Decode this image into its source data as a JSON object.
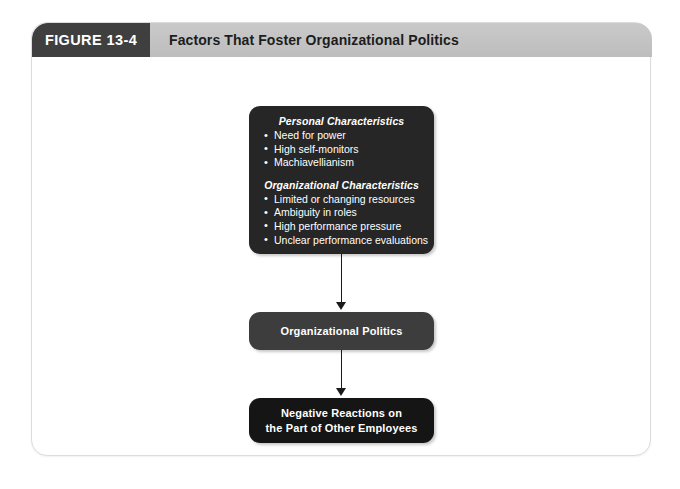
{
  "figure": {
    "tab_label": "FIGURE 13-4",
    "title": "Factors That Foster Organizational Politics"
  },
  "diagram": {
    "type": "flowchart",
    "direction": "top-to-bottom",
    "nodes": [
      {
        "id": "causes",
        "groups": [
          {
            "heading": "Personal Characteristics",
            "items": [
              "Need for power",
              "High self-monitors",
              "Machiavellianism"
            ]
          },
          {
            "heading": "Organizational Characteristics",
            "items": [
              "Limited or changing resources",
              "Ambiguity in roles",
              "High performance pressure",
              "Unclear performance evaluations"
            ]
          }
        ],
        "color": "#262626"
      },
      {
        "id": "politics",
        "text": "Organizational Politics",
        "color": "#3d3d3d"
      },
      {
        "id": "reactions",
        "text": "Negative Reactions on\nthe Part of Other Employees",
        "color": "#151515"
      }
    ],
    "edges": [
      {
        "from": "causes",
        "to": "politics",
        "style": "arrow"
      },
      {
        "from": "politics",
        "to": "reactions",
        "style": "arrow"
      }
    ]
  },
  "theme": {
    "header_band": "#c4c4c4",
    "tab_background": "#3f3f3f",
    "frame_border": "#dcdcdc",
    "connector_color": "#1a1a1a",
    "text_on_dark": "#ffffff"
  }
}
